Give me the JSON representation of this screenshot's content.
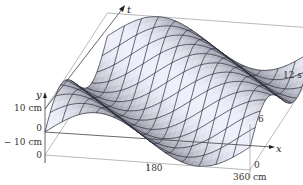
{
  "chart_data": {
    "type": "surface",
    "title": "",
    "function": "y(x,t) = 10 sin(2π(x/360 - t/12)) (traveling wave)",
    "axes": {
      "x": {
        "label": "x",
        "range": [
          0,
          360
        ],
        "unit": "cm",
        "ticks": [
          "0",
          "180",
          "360 cm"
        ]
      },
      "t": {
        "label": "t",
        "range": [
          0,
          12
        ],
        "unit": "s",
        "ticks": [
          "0",
          "6",
          "12 s"
        ]
      },
      "y": {
        "label": "y",
        "range": [
          -10,
          10
        ],
        "unit": "cm",
        "ticks": [
          "10 cm",
          "0",
          "−10 cm"
        ]
      }
    },
    "amplitude_cm": 10,
    "wavelength_cm": 360,
    "period_s": 12,
    "mesh_lines_x": 13,
    "mesh_lines_t": 13
  },
  "labels": {
    "y_axis": "y",
    "t_axis": "t",
    "x_axis": "x",
    "y_tick_pos": "10 cm",
    "y_tick_zero": "0",
    "y_tick_neg": "− 10 cm",
    "origin_zero": "0",
    "x_tick_mid": "180",
    "x_tick_end_zero": "0",
    "x_tick_end": "360 cm",
    "t_tick_mid": "6",
    "t_tick_end": "12 s"
  },
  "colors": {
    "surface_light": "#eceef4",
    "surface_dark": "#6a6c80",
    "mesh": "#2a2a38",
    "box": "#8a8a8a"
  }
}
